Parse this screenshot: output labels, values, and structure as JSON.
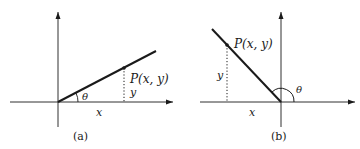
{
  "figure": {
    "panels": [
      {
        "id": "a",
        "caption": "(a)",
        "point_label": "P(x, y)",
        "angle_label": "θ",
        "x_label": "x",
        "y_label": "y",
        "quadrant": "I"
      },
      {
        "id": "b",
        "caption": "(b)",
        "point_label": "P(x, y)",
        "angle_label": "θ",
        "x_label": "x",
        "y_label": "y",
        "quadrant": "II"
      }
    ]
  },
  "colors": {
    "ink": "#1a1a1a",
    "background": "#ffffff"
  }
}
